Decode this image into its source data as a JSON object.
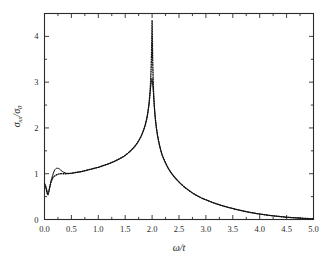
{
  "figure": {
    "background": "#ffffff",
    "frame_color": "#2b2b2b",
    "curve_color": "#101010"
  },
  "chart_data": {
    "type": "line",
    "title": "",
    "subtitle": "",
    "xlabel": "ω/t",
    "ylabel": "σxx/σ0",
    "ylabel_parts": {
      "sigma": "σ",
      "sub_xx": "xx",
      "slash": "/",
      "sigma2": "σ",
      "sub_0": "0"
    },
    "xlabel_parts": {
      "omega": "ω",
      "slash": "/",
      "t": "t"
    },
    "xlim": [
      0.0,
      5.0
    ],
    "ylim": [
      0.0,
      4.5
    ],
    "xticks": [
      0.0,
      0.5,
      1.0,
      1.5,
      2.0,
      2.5,
      3.0,
      3.5,
      4.0,
      4.5,
      5.0
    ],
    "xticklabels": [
      "0.0",
      "0.5",
      "1.0",
      "1.5",
      "2.0",
      "2.5",
      "3.0",
      "3.5",
      "4.0",
      "4.5",
      "5.0"
    ],
    "xminor_step": 0.25,
    "yticks": [
      0,
      1,
      2,
      3,
      4
    ],
    "yticklabels": [
      "0",
      "1",
      "2",
      "3",
      "4"
    ],
    "yminor_step": 0.5,
    "grid": false,
    "legend": null,
    "legend_position": "none",
    "annotations": [],
    "peak_position": 2.0,
    "series": [
      {
        "name": "dotted",
        "style": "dotted",
        "color": "#101010",
        "peak_value": 4.35,
        "x": [
          0.0,
          0.02,
          0.04,
          0.06,
          0.08,
          0.1,
          0.13,
          0.16,
          0.2,
          0.25,
          0.3,
          0.35,
          0.4,
          0.45,
          0.5,
          0.6,
          0.7,
          0.8,
          0.9,
          1.0,
          1.1,
          1.2,
          1.3,
          1.4,
          1.5,
          1.6,
          1.65,
          1.7,
          1.75,
          1.8,
          1.85,
          1.88,
          1.91,
          1.94,
          1.96,
          1.97,
          1.98,
          1.99,
          1.995,
          2.0,
          2.005,
          2.01,
          2.02,
          2.03,
          2.05,
          2.08,
          2.12,
          2.16,
          2.2,
          2.3,
          2.4,
          2.5,
          2.6,
          2.75,
          2.9,
          3.0,
          3.2,
          3.4,
          3.6,
          3.8,
          4.0,
          4.25,
          4.5,
          4.75,
          5.0
        ],
        "y": [
          0.78,
          0.72,
          0.62,
          0.54,
          0.6,
          0.72,
          0.84,
          0.92,
          0.96,
          0.99,
          1.0,
          1.0,
          1.0,
          1.005,
          1.01,
          1.03,
          1.05,
          1.08,
          1.11,
          1.14,
          1.18,
          1.22,
          1.27,
          1.33,
          1.4,
          1.5,
          1.56,
          1.63,
          1.72,
          1.83,
          1.98,
          2.1,
          2.26,
          2.5,
          2.78,
          2.97,
          3.25,
          3.65,
          3.98,
          4.35,
          3.95,
          3.55,
          3.05,
          2.72,
          2.34,
          2.0,
          1.72,
          1.52,
          1.37,
          1.12,
          0.95,
          0.82,
          0.71,
          0.58,
          0.48,
          0.43,
          0.34,
          0.27,
          0.21,
          0.16,
          0.12,
          0.08,
          0.05,
          0.03,
          0.015
        ]
      },
      {
        "name": "solid",
        "style": "solid",
        "color": "#101010",
        "peak_value": 3.08,
        "x": [
          0.0,
          0.02,
          0.04,
          0.06,
          0.08,
          0.1,
          0.12,
          0.15,
          0.18,
          0.21,
          0.24,
          0.27,
          0.3,
          0.33,
          0.36,
          0.4,
          0.45,
          0.5,
          0.6,
          0.7,
          0.8,
          0.9,
          1.0,
          1.1,
          1.2,
          1.3,
          1.4,
          1.5,
          1.6,
          1.65,
          1.7,
          1.75,
          1.8,
          1.85,
          1.88,
          1.91,
          1.94,
          1.96,
          1.97,
          1.98,
          1.99,
          2.0,
          2.01,
          2.02,
          2.03,
          2.05,
          2.08,
          2.12,
          2.16,
          2.2,
          2.3,
          2.4,
          2.5,
          2.6,
          2.75,
          2.9,
          3.0,
          3.2,
          3.4,
          3.6,
          3.8,
          4.0,
          4.25,
          4.5,
          4.75,
          5.0
        ],
        "y": [
          0.79,
          0.74,
          0.66,
          0.58,
          0.62,
          0.72,
          0.84,
          0.96,
          1.06,
          1.11,
          1.12,
          1.11,
          1.08,
          1.05,
          1.03,
          1.01,
          1.005,
          1.01,
          1.03,
          1.05,
          1.08,
          1.11,
          1.14,
          1.18,
          1.22,
          1.27,
          1.33,
          1.4,
          1.5,
          1.56,
          1.63,
          1.72,
          1.83,
          1.98,
          2.1,
          2.26,
          2.5,
          2.72,
          2.85,
          2.96,
          3.04,
          3.08,
          2.96,
          2.84,
          2.68,
          2.34,
          2.0,
          1.72,
          1.52,
          1.37,
          1.12,
          0.95,
          0.82,
          0.71,
          0.58,
          0.48,
          0.43,
          0.34,
          0.27,
          0.21,
          0.16,
          0.12,
          0.08,
          0.05,
          0.03,
          0.015
        ]
      }
    ]
  }
}
